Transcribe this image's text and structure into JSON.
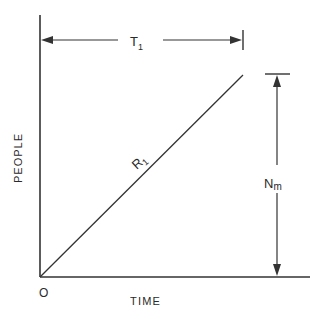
{
  "diagram": {
    "type": "line-diagram",
    "axes": {
      "x_label": "TIME",
      "y_label": "PEOPLE",
      "origin_label": "O"
    },
    "line": {
      "label_main": "R",
      "label_sub": "1",
      "from": "origin",
      "to": "peak"
    },
    "dimensions": {
      "time_span": {
        "label_main": "T",
        "label_sub": "1"
      },
      "people_max": {
        "label_main": "N",
        "label_sub": "m"
      }
    },
    "colors": {
      "stroke": "#333333",
      "background": "#ffffff"
    }
  }
}
